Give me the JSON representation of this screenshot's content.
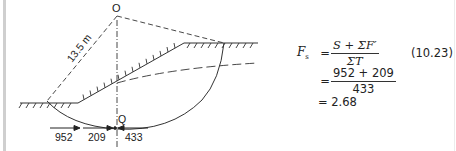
{
  "figure": {
    "center_label": "O",
    "radius_label": "13.5 m",
    "point_label": "Q",
    "forces": [
      {
        "label": "952",
        "direction": "right"
      },
      {
        "label": "209",
        "direction": "right"
      },
      {
        "label": "433",
        "direction": "left"
      }
    ],
    "colors": {
      "line": "#333333",
      "background": "#ffffff",
      "margin_bar": "#cfcfcf"
    }
  },
  "equation": {
    "lhs": "F",
    "lhs_sub": "s",
    "equals": "=",
    "line1_numerator": "S + ΣF′",
    "line1_denominator": "ΣT",
    "equation_number": "(10.23)",
    "line2_numerator": "952 + 209",
    "line2_denominator": "433",
    "line3_result": "= 2.68"
  }
}
